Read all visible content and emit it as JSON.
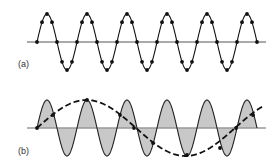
{
  "figure": {
    "panels": [
      {
        "id": "a",
        "label": "(a)",
        "description": "Sine wave sampled at 8 points per cycle (adequate sampling)",
        "axis": {
          "y": 42,
          "x_start": 27,
          "x_end": 266,
          "color": "#555555"
        },
        "signal": {
          "x_start": 37,
          "x_end": 257,
          "period_px": 40,
          "amplitude_px": 28,
          "color": "#111111",
          "fill": null
        },
        "samples_per_cycle": 8,
        "sample_dot_color": "#111111"
      },
      {
        "id": "b",
        "label": "(b)",
        "description": "Undersampled sine wave with aliased low-frequency reconstruction (dashed)",
        "axis": {
          "y": 128,
          "x_start": 27,
          "x_end": 266,
          "color": "#999999"
        },
        "signal": {
          "x_start": 37,
          "x_end": 257,
          "period_px": 40,
          "amplitude_px": 28,
          "color": "#222222",
          "fill": "#c8c8c8"
        },
        "alias": {
          "x_start": 37,
          "x_end": 262,
          "period_px": 198,
          "amplitude_px": 28,
          "color": "#111111",
          "dash": "6,3"
        },
        "sample_points": [
          [
            37,
            128
          ],
          [
            53,
            115
          ],
          [
            87,
            100
          ],
          [
            120,
            115
          ],
          [
            134,
            128
          ],
          [
            153,
            143
          ],
          [
            187,
            155
          ],
          [
            220,
            148
          ],
          [
            236,
            128
          ],
          [
            253,
            115
          ]
        ],
        "sample_dot_color": "#111111"
      }
    ]
  },
  "chart_data": {
    "type": "line",
    "title": "",
    "panels": [
      {
        "label": "(a)",
        "series": [
          {
            "name": "signal",
            "cycles": 5.5,
            "samples_per_cycle": 8
          }
        ]
      },
      {
        "label": "(b)",
        "series": [
          {
            "name": "signal",
            "cycles": 5.5,
            "shaded": true
          },
          {
            "name": "alias (dashed)",
            "cycles": 1.1,
            "dashed": true,
            "samples": 10
          }
        ]
      }
    ],
    "xlabel": "",
    "ylabel": "",
    "grid": false
  }
}
